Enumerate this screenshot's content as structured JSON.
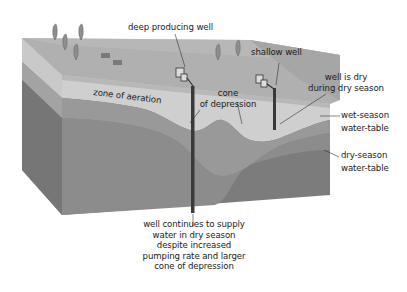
{
  "diagram": {
    "type": "cross-section block diagram",
    "colors": {
      "background": "#ffffff",
      "top_surface": "#a9a9a9",
      "top_surface_light": "#bdbdbd",
      "zone_of_aeration": "#cfcfcf",
      "saturated_wet": "#8e8e8e",
      "saturated_dry": "#7a7a7a",
      "left_face_upper": "#c9c9c9",
      "left_face_mid": "#8a8a8a",
      "left_face_lower": "#747474",
      "well_pipe": "#3a3a3a",
      "leader_line": "#333333"
    },
    "labels": {
      "deep_well": "deep producing well",
      "shallow_well": "shallow well",
      "zone_of_aeration": "zone of aeration",
      "cone_of_depression": [
        "cone",
        "of depression"
      ],
      "well_is_dry": [
        "well is dry",
        "during dry season"
      ],
      "wet_season": [
        "wet-season",
        "water-table"
      ],
      "dry_season": [
        "dry-season",
        "water-table"
      ],
      "well_continues": [
        "well continues to supply",
        "water in dry season",
        "despite increased",
        "pumping rate and larger",
        "cone of depression"
      ]
    }
  }
}
